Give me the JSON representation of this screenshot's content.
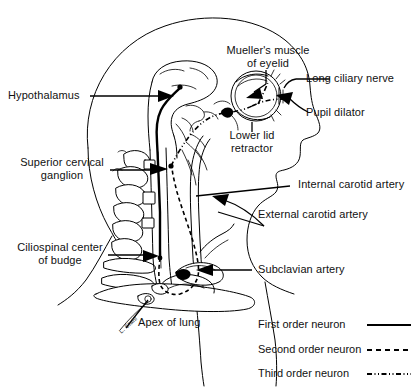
{
  "figure": {
    "background_color": "#ffffff",
    "ink_color": "#000000"
  },
  "labels": {
    "hypothalamus": "Hypothalamus",
    "superior_cervical_ganglion_line1": "Superior cervical",
    "superior_cervical_ganglion_line2": "ganglion",
    "ciliospinal_center_line1": "Ciliospinal center",
    "ciliospinal_center_line2": "of budge",
    "apex_of_lung": "Apex of lung",
    "muellers_muscle_line1": "Mueller's muscle",
    "muellers_muscle_line2": "of eyelid",
    "long_ciliary_nerve": "Long ciliary nerve",
    "pupil_dilator": "Pupil dilator",
    "lower_lid_retractor_line1": "Lower lid",
    "lower_lid_retractor_line2": "retractor",
    "internal_carotid_artery": "Internal carotid artery",
    "external_carotid_artery": "External carotid artery",
    "subclavian_artery": "Subclavian artery",
    "signature": "L. Stahl"
  },
  "legend": {
    "items": [
      {
        "label": "First order neuron",
        "line_style": "solid"
      },
      {
        "label": "Second order neuron",
        "line_style": "dashed"
      },
      {
        "label": "Third order neuron",
        "line_style": "dash-dot-dot"
      }
    ]
  }
}
